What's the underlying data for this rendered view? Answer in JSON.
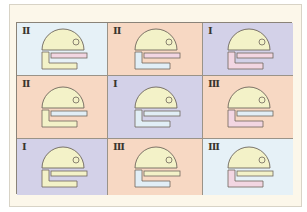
{
  "figure": {
    "grid": {
      "rows": 3,
      "cols": 3
    },
    "colors": {
      "light_blue": "#e6f1f7",
      "peach": "#f7d8c3",
      "lavender": "#d3d1e8",
      "shape_yellow": "#f3f2c8",
      "shape_pink": "#f2d6e2",
      "shape_blue": "#e1eef6",
      "outline": "#6e665c"
    },
    "cells": [
      {
        "row": 0,
        "col": 0,
        "numeral": "II",
        "bg": "light_blue",
        "dome": "shape_yellow",
        "bar": "shape_pink",
        "ell": "shape_yellow"
      },
      {
        "row": 0,
        "col": 1,
        "numeral": "II",
        "bg": "peach",
        "dome": "shape_yellow",
        "bar": "shape_pink",
        "ell": "shape_blue"
      },
      {
        "row": 0,
        "col": 2,
        "numeral": "I",
        "bg": "lavender",
        "dome": "shape_yellow",
        "bar": "shape_pink",
        "ell": "shape_pink"
      },
      {
        "row": 1,
        "col": 0,
        "numeral": "II",
        "bg": "peach",
        "dome": "shape_yellow",
        "bar": "shape_blue",
        "ell": "shape_yellow"
      },
      {
        "row": 1,
        "col": 1,
        "numeral": "I",
        "bg": "lavender",
        "dome": "shape_yellow",
        "bar": "shape_blue",
        "ell": "shape_blue"
      },
      {
        "row": 1,
        "col": 2,
        "numeral": "III",
        "bg": "peach",
        "dome": "shape_yellow",
        "bar": "shape_blue",
        "ell": "shape_pink"
      },
      {
        "row": 2,
        "col": 0,
        "numeral": "I",
        "bg": "lavender",
        "dome": "shape_yellow",
        "bar": "shape_yellow",
        "ell": "shape_yellow"
      },
      {
        "row": 2,
        "col": 1,
        "numeral": "III",
        "bg": "peach",
        "dome": "shape_yellow",
        "bar": "shape_yellow",
        "ell": "shape_blue"
      },
      {
        "row": 2,
        "col": 2,
        "numeral": "III",
        "bg": "light_blue",
        "dome": "shape_yellow",
        "bar": "shape_yellow",
        "ell": "shape_pink"
      }
    ]
  }
}
